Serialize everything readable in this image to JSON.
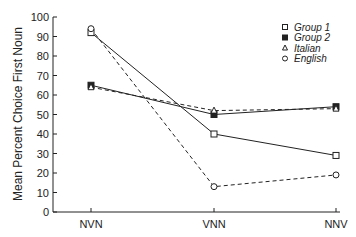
{
  "chart_data": {
    "type": "line",
    "title": "",
    "xlabel": "",
    "ylabel": "Mean Percent Choice First Noun",
    "categories": [
      "NVN",
      "VNN",
      "NNV"
    ],
    "ylim": [
      0,
      100
    ],
    "yticks": [
      0,
      10,
      20,
      30,
      40,
      50,
      60,
      70,
      80,
      90,
      100
    ],
    "grid": false,
    "legend_position": "upper right",
    "series": [
      {
        "name": "Group 1",
        "marker": "open-square",
        "line": "solid",
        "values": [
          92,
          40,
          29
        ]
      },
      {
        "name": "Group 2",
        "marker": "filled-square",
        "line": "solid",
        "values": [
          65,
          50,
          54
        ]
      },
      {
        "name": "Italian",
        "marker": "open-triangle",
        "line": "dashed",
        "values": [
          64,
          52,
          53
        ]
      },
      {
        "name": "English",
        "marker": "open-circle",
        "line": "dashed",
        "values": [
          94,
          13,
          19
        ]
      }
    ]
  },
  "colors": {
    "ink": "#222222",
    "background": "#ffffff"
  }
}
